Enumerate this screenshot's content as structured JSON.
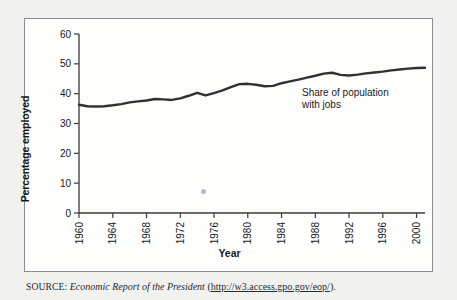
{
  "figure": {
    "source_prefix": "SOURCE:",
    "source_title": "Economic Report of the President",
    "source_paren_open": " (",
    "source_url": "http://w3.access.gpo.gov/eop/",
    "source_paren_close": ")."
  },
  "chart_data": {
    "type": "line",
    "title": "",
    "xlabel": "Year",
    "ylabel": "Percentage employed",
    "xlim": [
      1960,
      2001
    ],
    "ylim": [
      0,
      60
    ],
    "yticks": [
      0,
      10,
      20,
      30,
      40,
      50,
      60
    ],
    "xticks": [
      1960,
      1964,
      1968,
      1972,
      1976,
      1980,
      1984,
      1988,
      1992,
      1996,
      2000
    ],
    "ytick_labels": [
      "0",
      "10",
      "20",
      "30",
      "40",
      "50",
      "60"
    ],
    "xtick_labels": [
      "1960",
      "1964",
      "1968",
      "1972",
      "1976",
      "1980",
      "1984",
      "1988",
      "1992",
      "1996",
      "2000"
    ],
    "grid": false,
    "legend": "none",
    "annotations": [
      {
        "text": "Share of population\nwith jobs",
        "x": 1988,
        "y": 42
      }
    ],
    "series": [
      {
        "name": "Share of population with jobs",
        "color": "#33312f",
        "x": [
          1960,
          1961,
          1962,
          1963,
          1964,
          1965,
          1966,
          1967,
          1968,
          1969,
          1970,
          1971,
          1972,
          1973,
          1974,
          1975,
          1976,
          1977,
          1978,
          1979,
          1980,
          1981,
          1982,
          1983,
          1984,
          1985,
          1986,
          1987,
          1988,
          1989,
          1990,
          1991,
          1992,
          1993,
          1994,
          1995,
          1996,
          1997,
          1998,
          1999,
          2000,
          2001
        ],
        "values": [
          36.3,
          35.8,
          35.7,
          35.8,
          36.1,
          36.5,
          37.1,
          37.4,
          37.7,
          38.2,
          38.1,
          37.9,
          38.4,
          39.3,
          40.3,
          39.4,
          40.2,
          41.1,
          42.2,
          43.2,
          43.3,
          43.0,
          42.5,
          42.6,
          43.5,
          44.1,
          44.7,
          45.4,
          46.0,
          46.7,
          47.0,
          46.3,
          46.1,
          46.4,
          46.8,
          47.1,
          47.4,
          47.8,
          48.1,
          48.4,
          48.6,
          48.7
        ]
      }
    ]
  }
}
